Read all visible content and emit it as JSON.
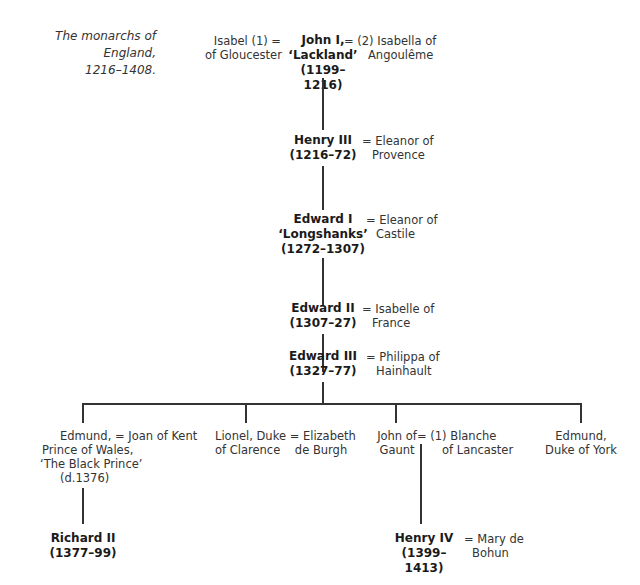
{
  "caption": {
    "line1": "The monarchs of England,",
    "line2": "1216–1408."
  },
  "generations": {
    "john": {
      "name": "John I,",
      "epithet": "‘Lackland’",
      "reign": "(1199–1216)",
      "spouse1": {
        "line1": "Isabel (1) =",
        "line2": "of Gloucester"
      },
      "spouse2": {
        "line1": "= (2) Isabella of",
        "line2": "Angoulême"
      }
    },
    "henry3": {
      "name": "Henry III",
      "reign": "(1216–72)",
      "spouse": {
        "line1": "= Eleanor of",
        "line2": "Provence"
      }
    },
    "edward1": {
      "name": "Edward I",
      "epithet": "‘Longshanks’",
      "reign": "(1272–1307)",
      "spouse": {
        "line1": "= Eleanor of",
        "line2": "Castile"
      }
    },
    "edward2": {
      "name": "Edward II",
      "reign": "(1307–27)",
      "spouse": {
        "line1": "= Isabelle of",
        "line2": "France"
      }
    },
    "edward3": {
      "name": "Edward III",
      "reign": "(1327–77)",
      "spouse": {
        "line1": "= Philippa of",
        "line2": "Hainhault"
      }
    }
  },
  "children": {
    "black_prince": {
      "lines": [
        "Edmund, = Joan of Kent",
        "Prince of Wales,",
        "‘The Black Prince’",
        "(d.1376)"
      ]
    },
    "lionel": {
      "line1": "Lionel, Duke = Elizabeth",
      "line2": "of Clarence    de Burgh"
    },
    "gaunt": {
      "name1": "John of",
      "name2": "Gaunt",
      "spouse1": "= (1) Blanche",
      "spouse2": "of Lancaster"
    },
    "york": {
      "line1": "Edmund,",
      "line2": "Duke of York"
    }
  },
  "grandchildren": {
    "richard2": {
      "name": "Richard II",
      "reign": "(1377–99)"
    },
    "henry4": {
      "name": "Henry IV",
      "reign": "(1399–1413)",
      "spouse": {
        "line1": "= Mary de",
        "line2": "Bohun"
      }
    }
  }
}
